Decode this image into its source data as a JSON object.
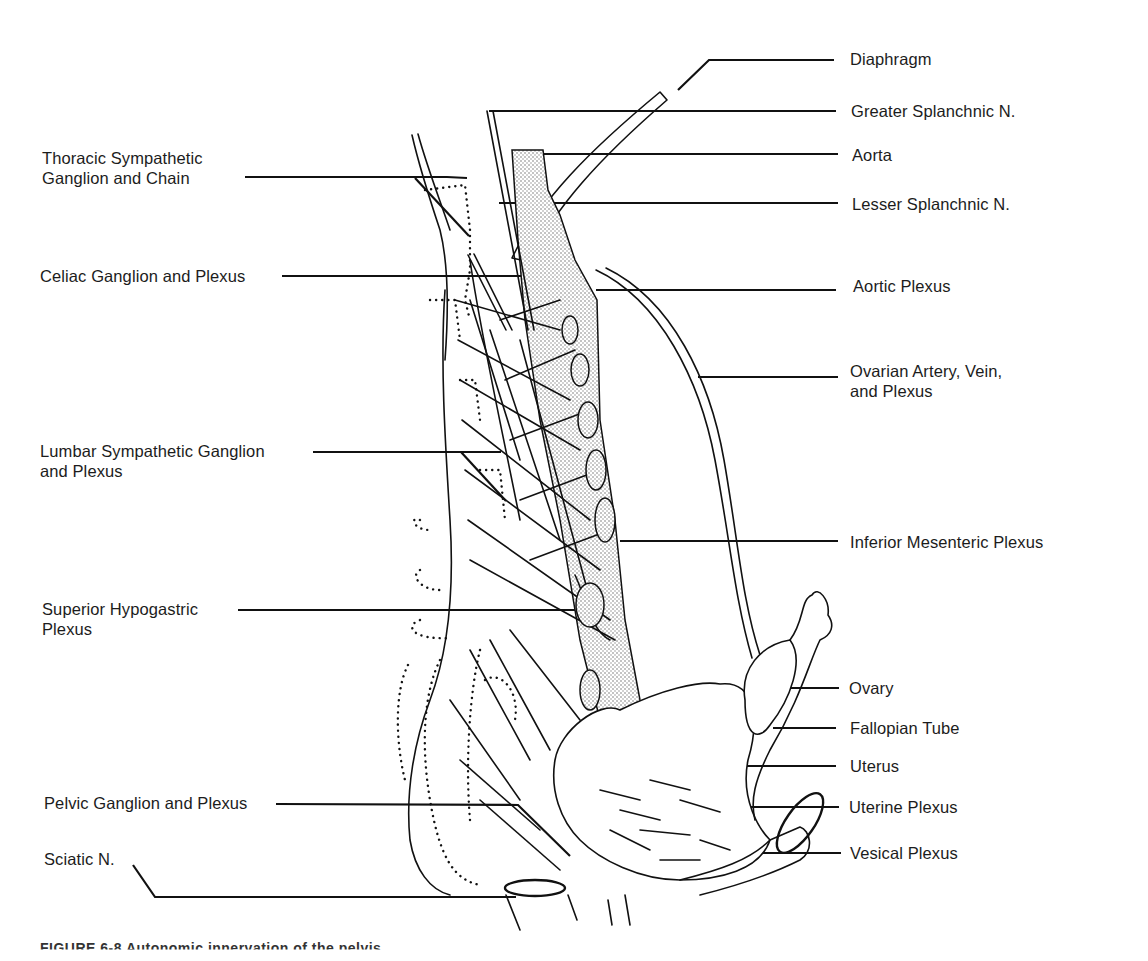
{
  "figure": {
    "type": "anatomical-line-drawing",
    "caption_partial": "FIGURE 6-8  Autonomic innervation of the pelvis"
  },
  "labels_left": [
    {
      "id": "thoracic",
      "text": "Thoracic Sympathetic\nGanglion and Chain"
    },
    {
      "id": "celiac",
      "text": "Celiac Ganglion and Plexus"
    },
    {
      "id": "lumbar",
      "text": "Lumbar Sympathetic Ganglion\nand Plexus"
    },
    {
      "id": "sup-hypogastric",
      "text": "Superior Hypogastric\nPlexus"
    },
    {
      "id": "pelvic",
      "text": "Pelvic Ganglion and Plexus"
    },
    {
      "id": "sciatic",
      "text": "Sciatic N."
    }
  ],
  "labels_right": [
    {
      "id": "diaphragm",
      "text": "Diaphragm"
    },
    {
      "id": "greater-splanchnic",
      "text": "Greater Splanchnic N."
    },
    {
      "id": "aorta",
      "text": "Aorta"
    },
    {
      "id": "lesser-splanchnic",
      "text": "Lesser Splanchnic N."
    },
    {
      "id": "aortic-plexus",
      "text": "Aortic Plexus"
    },
    {
      "id": "ovarian",
      "text": "Ovarian Artery, Vein,\nand Plexus"
    },
    {
      "id": "inf-mesenteric",
      "text": "Inferior Mesenteric Plexus"
    },
    {
      "id": "ovary",
      "text": "Ovary"
    },
    {
      "id": "fallopian",
      "text": "Fallopian Tube"
    },
    {
      "id": "uterus",
      "text": "Uterus"
    },
    {
      "id": "uterine-plexus",
      "text": "Uterine Plexus"
    },
    {
      "id": "vesical-plexus",
      "text": "Vesical Plexus"
    }
  ],
  "colors": {
    "ink": "#111111",
    "background": "#ffffff",
    "stipple": "#9a9a9a"
  }
}
